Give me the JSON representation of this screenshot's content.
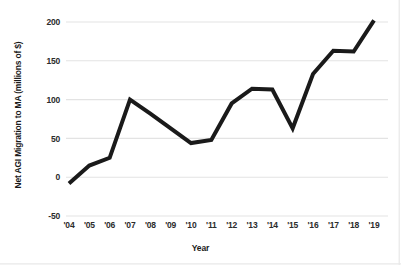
{
  "chart_data": {
    "type": "line",
    "title": "",
    "xlabel": "Year",
    "ylabel": "Net AGI Migration to MA (millions of $)",
    "categories": [
      "'04",
      "'05",
      "'06",
      "'07",
      "'08",
      "'09",
      "'10",
      "'11",
      "'12",
      "'13",
      "'14",
      "'15",
      "'16",
      "'17",
      "'18",
      "'19"
    ],
    "values": [
      -8,
      15,
      25,
      100,
      82,
      63,
      44,
      48,
      95,
      114,
      113,
      63,
      133,
      163,
      162,
      202
    ],
    "series": [
      {
        "name": "Net AGI Migration to MA (millions of $)",
        "values": [
          -8,
          15,
          25,
          100,
          82,
          63,
          44,
          48,
          95,
          114,
          113,
          63,
          133,
          163,
          162,
          202
        ]
      }
    ],
    "x": [
      "2004",
      "2005",
      "2006",
      "2007",
      "2008",
      "2009",
      "2010",
      "2011",
      "2012",
      "2013",
      "2014",
      "2015",
      "2016",
      "2017",
      "2018",
      "2019"
    ],
    "ylim": [
      -50,
      200
    ],
    "yticks": [
      -50,
      0,
      50,
      100,
      150,
      200
    ],
    "ytick_labels": [
      "-50",
      "0",
      "50",
      "100",
      "150",
      "200"
    ],
    "grid": true,
    "grid_axis": "y",
    "legend": false,
    "legend_position": "none",
    "line_color": "#1a1a1a",
    "grid_color": "#e3e3e3",
    "background_color": "#ffffff",
    "line_width": 4
  }
}
